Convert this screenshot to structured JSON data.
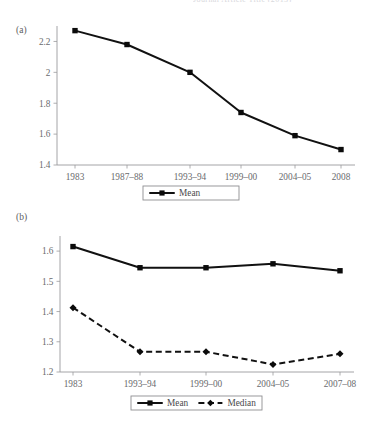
{
  "document": {
    "top_cropped_text": "Journal Article Title  (2013)"
  },
  "panels": [
    {
      "id": "a",
      "label": "(a)"
    },
    {
      "id": "b",
      "label": "(b)"
    }
  ],
  "chart_data": [
    {
      "type": "line",
      "panel": "(a)",
      "title": "",
      "xlabel": "",
      "ylabel": "",
      "categories": [
        "1983",
        "1987–88",
        "1993–94",
        "1999–00",
        "2004–05",
        "2008"
      ],
      "ylim": [
        1.4,
        2.3
      ],
      "yticks": [
        1.4,
        1.6,
        1.8,
        2.0,
        2.2
      ],
      "ytick_labels": [
        "1.4",
        "1.6",
        "1.8",
        "2",
        "2.2"
      ],
      "grid": false,
      "legend_position": "bottom",
      "series": [
        {
          "name": "Mean",
          "marker": "square",
          "linestyle": "solid",
          "color": "#0b0b0b",
          "values": [
            2.27,
            2.18,
            2.0,
            1.74,
            1.59,
            1.5
          ]
        }
      ]
    },
    {
      "type": "line",
      "panel": "(b)",
      "title": "",
      "xlabel": "",
      "ylabel": "",
      "categories": [
        "1983",
        "1993–94",
        "1999–00",
        "2004–05",
        "2007–08"
      ],
      "ylim": [
        1.2,
        1.65
      ],
      "yticks": [
        1.2,
        1.3,
        1.4,
        1.5,
        1.6
      ],
      "ytick_labels": [
        "1.2",
        "1.3",
        "1.4",
        "1.5",
        "1.6"
      ],
      "grid": false,
      "legend_position": "bottom",
      "series": [
        {
          "name": "Mean",
          "marker": "square",
          "linestyle": "solid",
          "color": "#0b0b0b",
          "values": [
            1.615,
            1.545,
            1.545,
            1.558,
            1.535
          ]
        },
        {
          "name": "Median",
          "marker": "diamond",
          "linestyle": "dashed",
          "color": "#0b0b0b",
          "values": [
            1.413,
            1.267,
            1.267,
            1.225,
            1.26
          ]
        }
      ]
    }
  ]
}
